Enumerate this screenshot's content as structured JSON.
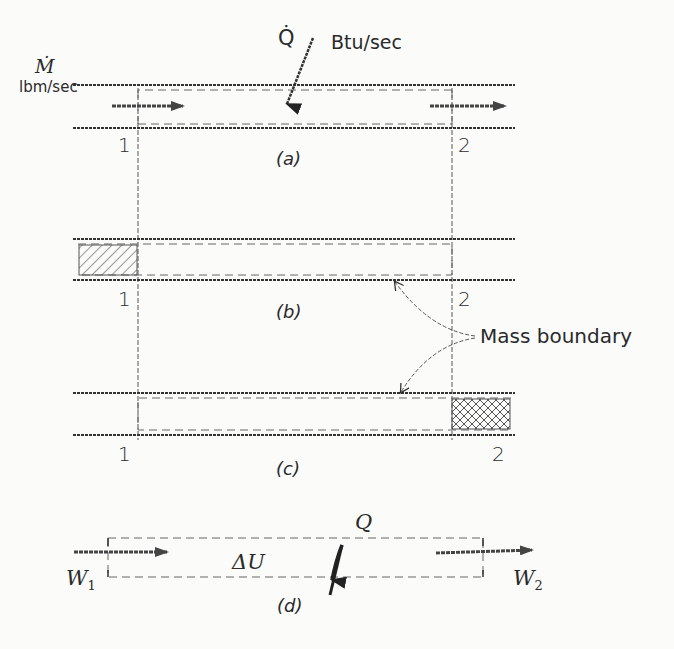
{
  "figure": {
    "panel_a": {
      "caption": "(a)",
      "mass_flow_symbol": "Ṁ",
      "mass_flow_unit": "lbm/sec",
      "heat_symbol": "Q̇",
      "heat_unit": "Btu/sec",
      "section_left": "1",
      "section_right": "2"
    },
    "panel_b": {
      "caption": "(b)",
      "section_left": "1",
      "section_right": "2"
    },
    "panel_c": {
      "caption": "(c)",
      "section_left": "1",
      "section_right": "2"
    },
    "annotation": {
      "mass_boundary": "Mass boundary"
    },
    "panel_d": {
      "caption": "(d)",
      "internal_energy": "ΔU",
      "heat": "Q",
      "work_in": "W",
      "work_in_sub": "1",
      "work_out": "W",
      "work_out_sub": "2"
    },
    "colors": {
      "ink": "#2a2a2a",
      "hatch": "#555555",
      "paper": "#fbfbfa"
    }
  }
}
